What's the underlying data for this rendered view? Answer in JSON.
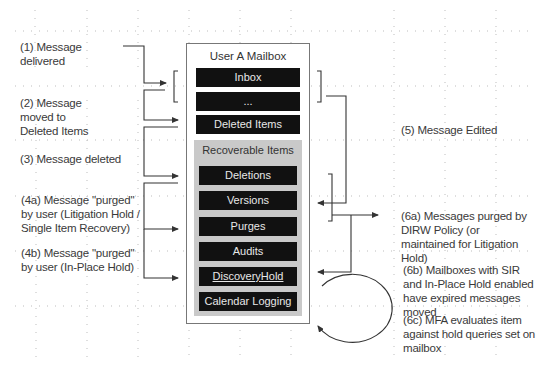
{
  "mailbox": {
    "title": "User A Mailbox",
    "folders": [
      {
        "label": "Inbox"
      },
      {
        "label": "..."
      },
      {
        "label": "Deleted Items"
      }
    ],
    "recoverable_items": {
      "title": "Recoverable Items",
      "subfolders": [
        {
          "label": "Deletions"
        },
        {
          "label": "Versions"
        },
        {
          "label": "Purges"
        },
        {
          "label": "Audits"
        },
        {
          "label": "DiscoveryHold"
        },
        {
          "label": "Calendar Logging"
        }
      ]
    }
  },
  "steps": {
    "s1": "(1) Message delivered",
    "s1_lines": [
      "(1) Message",
      "delivered"
    ],
    "s2_lines": [
      "(2) Message",
      "moved to",
      "Deleted Items"
    ],
    "s3_lines": [
      "(3) Message deleted"
    ],
    "s4a_lines": [
      "(4a) Message \"purged\"",
      "by user (Litigation Hold /",
      "Single Item Recovery)"
    ],
    "s4b_lines": [
      "(4b) Message \"purged\"",
      "by user (In-Place Hold)"
    ],
    "s5_lines": [
      "(5) Message Edited"
    ],
    "s6a_lines": [
      "(6a) Messages purged by",
      "DIRW Policy (or",
      "maintained for Litigation",
      "Hold)"
    ],
    "s6b_lines": [
      "(6b) Mailboxes with SIR",
      "and In-Place Hold enabled",
      "have expired messages",
      "moved"
    ],
    "s6c_lines": [
      "(6c) MFA evaluates item",
      "against hold queries set on",
      "mailbox"
    ]
  },
  "colors": {
    "folder_bg": "#111111",
    "folder_text": "#e8e8e8",
    "recoverable_bg": "#c9c9c9",
    "line": "#333333",
    "grid_dot": "#bbbbbb"
  }
}
